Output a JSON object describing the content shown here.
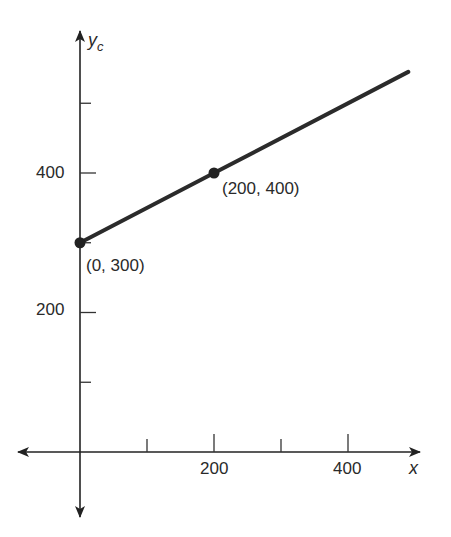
{
  "chart_data": {
    "type": "line",
    "title": "",
    "xlabel": "x",
    "ylabel": "y_c",
    "xlim": [
      -95,
      505
    ],
    "ylim": [
      -95,
      600
    ],
    "x_ticks": [
      100,
      200,
      300,
      400
    ],
    "x_tick_labels": [
      "",
      "200",
      "",
      "400"
    ],
    "y_ticks": [
      100,
      200,
      300,
      400,
      500
    ],
    "y_tick_labels": [
      "",
      "200",
      "",
      "400",
      ""
    ],
    "grid": false,
    "series": [
      {
        "name": "y_c = 300 + 0.5x",
        "x": [
          0,
          200,
          490
        ],
        "y": [
          300,
          400,
          545
        ]
      }
    ],
    "points": [
      {
        "x": 0,
        "y": 300,
        "label": "(0, 300)"
      },
      {
        "x": 200,
        "y": 400,
        "label": "(200, 400)"
      }
    ],
    "line_color": "#2b2b2b"
  },
  "labels": {
    "y_axis_main": "y",
    "y_axis_sub": "c",
    "x_axis": "x",
    "y400": "400",
    "y200": "200",
    "x200": "200",
    "x400": "400",
    "p1": "(0, 300)",
    "p2": "(200, 400)"
  }
}
